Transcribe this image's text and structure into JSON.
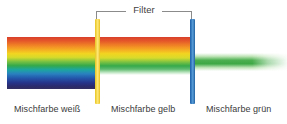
{
  "figure": {
    "title": "Filter",
    "bands": [
      {
        "id": "white",
        "caption": "Mischfarbe weiß",
        "description": "full visible spectrum",
        "colors": [
          "#d8402a",
          "#ef7d26",
          "#f5a623",
          "#f2d521",
          "#7cc242",
          "#35a94b",
          "#1ba6a0",
          "#2a7fc0",
          "#2357ab",
          "#27348b",
          "#332f63"
        ]
      },
      {
        "id": "yellow",
        "caption": "Mischfarbe gelb",
        "description": "spectrum after yellow filter, blue and violet removed",
        "colors": [
          "#d8402a",
          "#ef7d26",
          "#f5a623",
          "#f2d521",
          "#7cc242",
          "#35a94b"
        ]
      },
      {
        "id": "green",
        "caption": "Mischfarbe grün",
        "description": "only green remains after blue filter",
        "colors": [
          "#4cb050",
          "#3da844"
        ]
      }
    ],
    "filters": [
      {
        "id": "yellow-filter",
        "color": "#f6dd55",
        "label": "Filter"
      },
      {
        "id": "blue-filter",
        "color": "#3d84c6",
        "label": "Filter"
      }
    ],
    "bracket": {
      "line_color": "#8b8b8b"
    }
  }
}
